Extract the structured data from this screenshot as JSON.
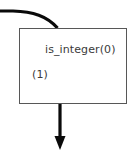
{
  "diagram": {
    "type": "flowchart-node",
    "canvas": {
      "width": 135,
      "height": 160,
      "background": "#ffffff"
    },
    "node": {
      "id": "is-integer-node",
      "primary_label": "is_integer(0)",
      "secondary_label": "(1)",
      "border_color": "#575757",
      "fill_color": "#ffffff",
      "text_color": "#3a3a3a"
    },
    "edges": [
      {
        "id": "incoming-edge",
        "name": "incoming-curved-edge",
        "direction": "into-node-top",
        "style": "curved",
        "color": "#0a0a0a",
        "width": 3,
        "arrowhead": "none"
      },
      {
        "id": "outgoing-edge",
        "name": "outgoing-arrow-edge",
        "direction": "out-of-node-bottom",
        "style": "straight-vertical",
        "color": "#0a0a0a",
        "width": 3,
        "arrowhead": "solid-triangle"
      }
    ]
  }
}
